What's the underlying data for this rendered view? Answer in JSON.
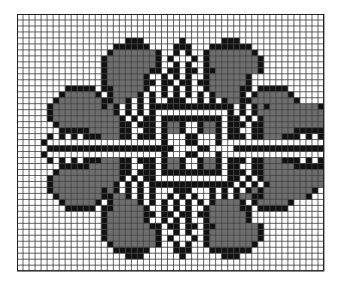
{
  "figure": {
    "title": "",
    "grid": {
      "cols": 51,
      "rows": 43,
      "cell_w": 6.02,
      "cell_h": 5.98,
      "origin_x": 17,
      "origin_y": 14
    },
    "colors": {
      "background": "#ffffff",
      "grid_line": "#3a3a3a",
      "stitch_black": "#111111",
      "stitch_gray": "#6e6e6e"
    },
    "legend": {
      "#": "black stitch",
      "g": "gray stitch",
      ".": "empty"
    },
    "pattern_rows": [
      "...................................................",
      "...................................................",
      "...................................................",
      "...................................................",
      "..................###......#......###..............",
      "................######....###...#######............",
      "...............#ggggggg#..#.#..#ggggggg#...........",
      "..............#gggggggg#.#...#.#gggggggg#..........",
      "..............#gggggggg#..#.#..#gggggggg#..........",
      "..............#ggggggg##.##.##.##ggggggg#..........",
      "..............#gggggg#..#.#.#..#gggggg#...........",
      "..............#gggggg##.##.##.##gggggg#...........",
      "........#####.##ggggg#..#.#.#..#ggggg##.#####......",
      ".......#ggggg#.#gggg#.#.#.#.#.#.#gggg#.#ggggg#.....",
      "......#ggggggg##gg#.#.#..###..#.#.#gg##ggggggg#....",
      ".....#gggggggg#g#.#.#.##############.#.#g#gggggggg#.",
      ".....#gggggggggg#.#.#.#............#.#.#ggggggggggg#",
      ".....#ggggggggggg#.#.##.##########.##.#.#ggggggggggg#",
      "......#gggggggggg##.###.#gg#..#gg#.###.##gggggggggg#.",
      ".......#####ggggg##..##.#gg#..#gg#.##..##ggggg#####..",
      ".....#.#.#.###ggg##.###.#...##...#.###.##ggg###.#.#.#",
      "....#...................#...##...#...................#",
      ".....#####################....##....#####################",
      "....#...................#...##...#...................#",
      ".....#.#.#.###ggg##.###.#gg#..#gg#.###.##ggg###.#.#.#",
      ".......#####ggggg##..##.#gg#..#gg#.##..##ggggg#####..",
      "......#gggggggggg##.###.##########.###.##gggggggggg#.",
      ".....#ggggggggggg#.#.##............##.#.#ggggggggggg#",
      ".....#gggggggggg#.#.#.##############.#.#.#ggggggggggg#",
      ".....#gggggggg#g#.#.#.#...###...#.#.#.#g#gggggggg#.",
      "......#ggggggg##gg#.#.#..#.#.#..#.#.#gg##ggggggg#....",
      ".......#ggggg#.#gggg#.#.#.#.#.#.#gggg#.#ggggg#.....",
      "........#####.##ggggg#..#.#.#..#ggggg##.#####......",
      "..............#gggggg##.##.##.##gggggg#...........",
      "..............#gggggg#..#.#.#..#gggggg#...........",
      "..............#ggggggg##.##.##.##ggggggg#..........",
      "..............#gggggggg#..#.#..#gggggggg#..........",
      "..............#gggggggg#.#...#.#gggggggg#..........",
      "...............#ggggggg#..#.#..#ggggggg#...........",
      "................######....###...#######............",
      "..................###......#......###..............",
      "...................................................",
      "..................................................."
    ]
  }
}
